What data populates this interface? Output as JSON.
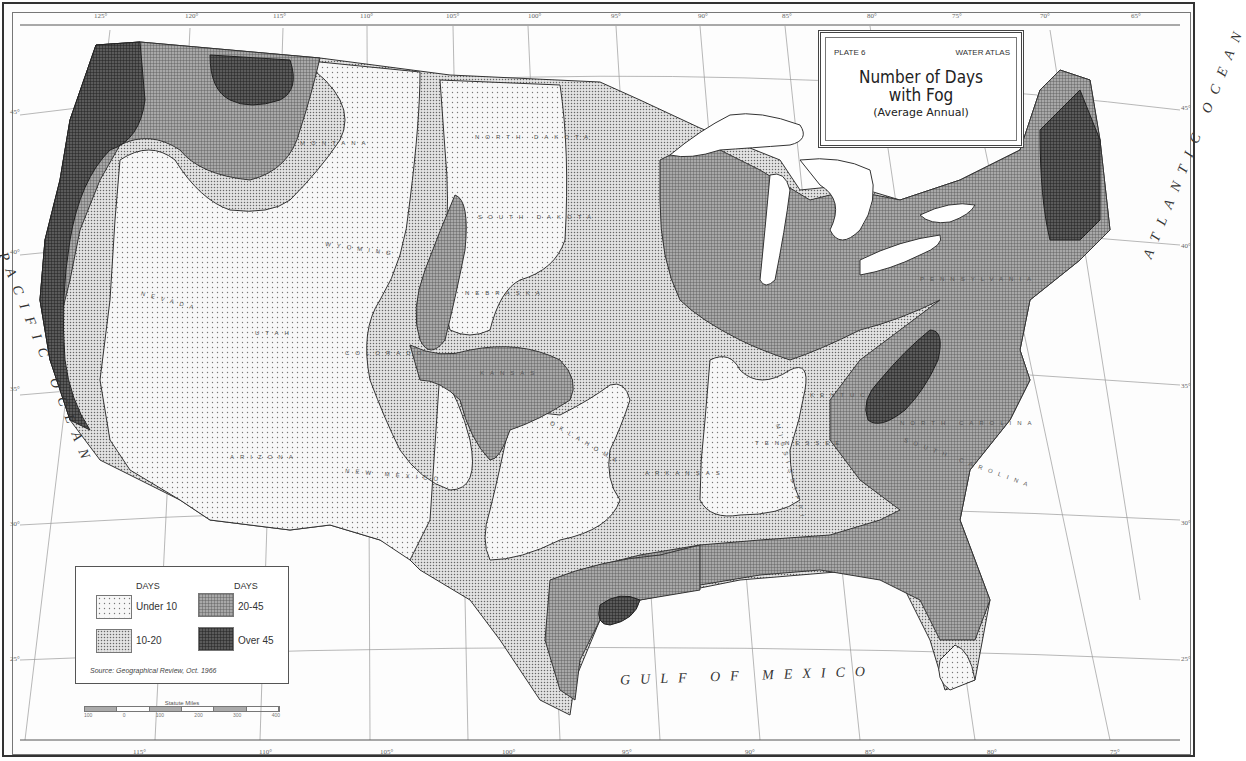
{
  "title_box": {
    "plate": "PLATE 6",
    "atlas": "WATER ATLAS",
    "title_line1": "Number of Days",
    "title_line2": "with Fog",
    "subtitle": "(Average Annual)"
  },
  "legend": {
    "header_left": "DAYS",
    "header_right": "DAYS",
    "items": [
      {
        "label": "Under 10",
        "pattern": "sparse-dots",
        "fill": "#f4f4f4"
      },
      {
        "label": "10-20",
        "pattern": "dense-dots",
        "fill": "#d4d4d4"
      },
      {
        "label": "20-45",
        "pattern": "grid",
        "fill": "#8e8e8e"
      },
      {
        "label": "Over 45",
        "pattern": "dense-grid",
        "fill": "#4a4a4a"
      }
    ],
    "source": "Source: Geographical Review, Oct. 1966"
  },
  "scale_bar": {
    "title": "Statute Miles",
    "ticks": [
      "100",
      "0",
      "100",
      "200",
      "300",
      "400"
    ]
  },
  "longitude_top": [
    "125°",
    "120°",
    "115°",
    "110°",
    "105°",
    "100°",
    "95°",
    "90°",
    "85°",
    "80°",
    "75°",
    "70°",
    "65°"
  ],
  "longitude_bottom": [
    "115°",
    "110°",
    "105°",
    "100°",
    "95°",
    "90°",
    "85°",
    "80°",
    "75°"
  ],
  "latitude_left": [
    "45°",
    "40°",
    "35°",
    "30°",
    "25°"
  ],
  "latitude_right": [
    "45°",
    "40°",
    "35°",
    "30°",
    "25°"
  ],
  "labels": {
    "pacific_ocean": "PACIFIC OCEAN",
    "atlantic_ocean": "ATLANTIC OCEAN",
    "gulf_of_mexico": "GULF OF MEXICO",
    "lake_superior": "LAKE SUPERIOR",
    "lake_michigan": "LAKE MICHIGAN",
    "lake_huron": "LAKE HURON",
    "lake_erie": "LAKE ERIE",
    "lake_ontario": "L. ONTARIO"
  },
  "states": [
    {
      "name": "NORTH DAKOTA"
    },
    {
      "name": "SOUTH DAKOTA"
    },
    {
      "name": "NEBRASKA"
    },
    {
      "name": "WYOMING"
    },
    {
      "name": "NEVADA"
    },
    {
      "name": "UTAH"
    },
    {
      "name": "COLORADO"
    },
    {
      "name": "ARIZONA"
    },
    {
      "name": "NEW MEXICO"
    },
    {
      "name": "KANSAS"
    },
    {
      "name": "OKLAHOMA"
    },
    {
      "name": "ARKANSAS"
    },
    {
      "name": "TENNESSEE"
    },
    {
      "name": "KENTUCKY"
    },
    {
      "name": "NORTH CAROLINA"
    },
    {
      "name": "SOUTH CAROLINA"
    },
    {
      "name": "PENNSYLVANIA"
    },
    {
      "name": "MISSISSIPPI"
    },
    {
      "name": "MONTANA"
    }
  ],
  "cities": [
    "GALVESTON",
    "WEST PALM BEACH",
    "KEY WEST",
    "PORTLAND",
    "BOSTON",
    "NEWPORT",
    "SALT LAKE CITY",
    "ALBUQUERQUE",
    "SAN DIEGO",
    "EL PASO",
    "DALLAS",
    "FORT WORTH",
    "SAN ANTONIO",
    "OKLAHOMA CITY",
    "MEMPHIS",
    "MIAMI",
    "WINNIPEG",
    "BISMARCK",
    "PIERRE",
    "RENO",
    "CARSON CITY",
    "TUCSON",
    "GREAT FALLS"
  ]
}
